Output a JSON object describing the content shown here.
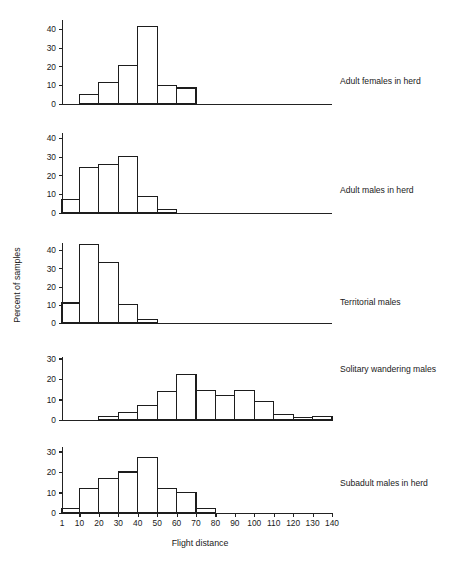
{
  "figure": {
    "x_axis_title": "Flight distance",
    "y_axis_title": "Percent of samples"
  },
  "panels": [
    {
      "label": "Adult females in herd"
    },
    {
      "label": "Adult males in herd"
    },
    {
      "label": "Territorial males"
    },
    {
      "label": "Solitary wandering males"
    },
    {
      "label": "Subadult males in herd"
    }
  ],
  "x_tick_labels": [
    "1",
    "10",
    "20",
    "30",
    "40",
    "50",
    "60",
    "70",
    "80",
    "90",
    "100",
    "110",
    "120",
    "130",
    "140"
  ],
  "chart_data": [
    {
      "type": "bar",
      "title": "Adult females in herd",
      "xlabel": "Flight distance",
      "ylabel": "Percent of samples",
      "xlim": [
        1,
        140
      ],
      "ylim": [
        0,
        45
      ],
      "yticks": [
        0,
        10,
        20,
        30,
        40
      ],
      "ytick_labels": [
        "0",
        "10",
        "20",
        "30",
        "40"
      ],
      "grid": false,
      "bin_edges": [
        10,
        20,
        30,
        40,
        50,
        60,
        70
      ],
      "values": [
        5,
        11.5,
        20.5,
        41,
        10,
        8.5
      ]
    },
    {
      "type": "bar",
      "title": "Adult males in herd",
      "xlabel": "Flight distance",
      "ylabel": "Percent of samples",
      "xlim": [
        1,
        140
      ],
      "ylim": [
        0,
        45
      ],
      "yticks": [
        0,
        10,
        20,
        30,
        40
      ],
      "ytick_labels": [
        "0",
        "10",
        "20",
        "30",
        "40"
      ],
      "grid": false,
      "bin_edges": [
        1,
        10,
        20,
        30,
        40,
        50,
        60
      ],
      "values": [
        7,
        24,
        26,
        30,
        9,
        2
      ]
    },
    {
      "type": "bar",
      "title": "Territorial males",
      "xlabel": "Flight distance",
      "ylabel": "Percent of samples",
      "xlim": [
        1,
        140
      ],
      "ylim": [
        0,
        47
      ],
      "yticks": [
        0,
        10,
        20,
        30,
        40
      ],
      "ytick_labels": [
        "0",
        "10",
        "20",
        "30",
        "40"
      ],
      "grid": false,
      "bin_edges": [
        1,
        10,
        20,
        30,
        40,
        50
      ],
      "values": [
        11,
        43,
        33,
        10,
        2
      ]
    },
    {
      "type": "bar",
      "title": "Solitary wandering males",
      "xlabel": "Flight distance",
      "ylabel": "Percent of samples",
      "xlim": [
        1,
        140
      ],
      "ylim": [
        0,
        33
      ],
      "yticks": [
        0,
        10,
        20,
        30
      ],
      "ytick_labels": [
        "0",
        "10",
        "20",
        "30"
      ],
      "grid": false,
      "bin_edges": [
        20,
        30,
        40,
        50,
        60,
        70,
        80,
        90,
        100,
        110,
        120,
        130,
        140
      ],
      "values": [
        1.5,
        3.5,
        7,
        14,
        22,
        14.5,
        12,
        14.5,
        9,
        2.5,
        1,
        1.5
      ]
    },
    {
      "type": "bar",
      "title": "Subadult males in herd",
      "xlabel": "Flight distance",
      "ylabel": "Percent of samples",
      "xlim": [
        1,
        140
      ],
      "ylim": [
        0,
        36
      ],
      "yticks": [
        0,
        10,
        20,
        30
      ],
      "ytick_labels": [
        "0",
        "10",
        "20",
        "30"
      ],
      "grid": false,
      "bin_edges": [
        1,
        10,
        20,
        30,
        40,
        50,
        60,
        70,
        80
      ],
      "values": [
        2,
        12,
        17,
        20,
        27,
        12,
        10,
        2
      ]
    }
  ]
}
